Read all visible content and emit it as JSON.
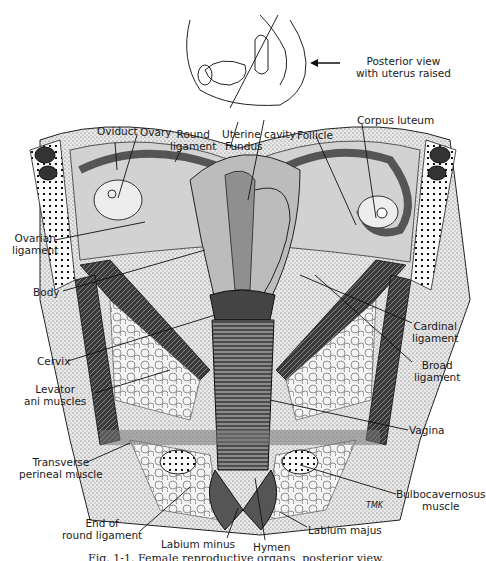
{
  "inset": {
    "note_line1": "Posterior view",
    "note_line2": "with uterus raised",
    "arrow": "left-arrow"
  },
  "labels": {
    "oviduct": "Oviduct",
    "ovary": "Ovary",
    "round_ligament_1": "Round",
    "round_ligament_2": "ligament",
    "uterine_cavity": "Uterine cavity",
    "fundus": "Fundus",
    "follicle": "Follicle",
    "corpus_luteum": "Corpus luteum",
    "ovarian_ligament_1": "Ovarian",
    "ovarian_ligament_2": "ligament",
    "body": "Body",
    "cardinal_ligament_1": "Cardinal",
    "cardinal_ligament_2": "ligament",
    "cervix": "Cervix",
    "broad_ligament_1": "Broad",
    "broad_ligament_2": "ligament",
    "levator_1": "Levator",
    "levator_2": "ani muscles",
    "vagina": "Vagina",
    "transverse_1": "Transverse",
    "transverse_2": "perineal muscle",
    "bulbo_1": "Bulbocavernosus",
    "bulbo_2": "muscle",
    "end_round_1": "End of",
    "end_round_2": "round ligament",
    "labium_minus": "Labium minus",
    "hymen": "Hymen",
    "labium_majus": "Labium majus",
    "signature": "TMK"
  },
  "caption": "Fig. 1-1. Female reproductive organs, posterior view."
}
